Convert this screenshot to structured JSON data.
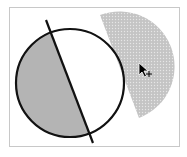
{
  "diagram": {
    "colors": {
      "outline": "#111111",
      "shaded_segment": "#b4b4b4",
      "dragged_piece": "#c4c4c4",
      "dragged_piece_dots": "#e6e6e6",
      "frame_border": "#c8c8c8"
    },
    "cursor": "move-cursor"
  }
}
